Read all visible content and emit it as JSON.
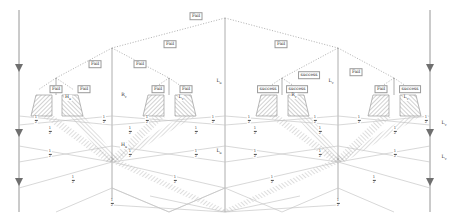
{
  "figure": {
    "width": 449,
    "height": 219,
    "background": "#ffffff",
    "colors": {
      "axis": "#8a8a8a",
      "solid_edge": "#b9b9b9",
      "dotted_edge": "#a9a9a9",
      "hatch": "#8e8e8e",
      "label_text": "#2e2e2e",
      "label_border": "#9a9a9a"
    }
  },
  "labels": {
    "fail": "Fail",
    "success": "success",
    "fraction_numerator": "1",
    "fraction_denominator": "2"
  },
  "tree": {
    "root": {
      "x": 225,
      "y": 18,
      "edge_label": "Fail"
    },
    "level1": [
      {
        "id": "n-l1-left",
        "x": 112,
        "y": 48,
        "edge_label": "Fail"
      },
      {
        "id": "n-l1-right",
        "x": 338,
        "y": 48,
        "edge_label": "Fail"
      }
    ],
    "level2": [
      {
        "id": "n-l2-a",
        "x": 56,
        "y": 78,
        "edge_label": "Fail"
      },
      {
        "id": "n-l2-b",
        "x": 169,
        "y": 78,
        "edge_label": "Fail"
      },
      {
        "id": "n-l2-c",
        "x": 282,
        "y": 78,
        "edge_label": "success"
      },
      {
        "id": "n-l2-d",
        "x": 394,
        "y": 78,
        "edge_label": "Fail"
      }
    ]
  },
  "edge_labels": [
    {
      "id": "e-root",
      "text": "Fail",
      "x": 196,
      "y": 16
    },
    {
      "id": "e-l1-left",
      "text": "Fail",
      "x": 170,
      "y": 44
    },
    {
      "id": "e-l1-right",
      "text": "Fail",
      "x": 281,
      "y": 44
    },
    {
      "id": "e-l2-a",
      "text": "Fail",
      "x": 95,
      "y": 64
    },
    {
      "id": "e-l2-b",
      "text": "Fail",
      "x": 140,
      "y": 64
    },
    {
      "id": "e-l2-c",
      "text": "success",
      "x": 309,
      "y": 75
    },
    {
      "id": "e-l2-d",
      "text": "Fail",
      "x": 356,
      "y": 72
    },
    {
      "id": "e-leaf-a1",
      "text": "Fail",
      "x": 56,
      "y": 89
    },
    {
      "id": "e-leaf-a2",
      "text": "Fail",
      "x": 84,
      "y": 89
    },
    {
      "id": "e-leaf-b1",
      "text": "Fail",
      "x": 158,
      "y": 89
    },
    {
      "id": "e-leaf-b2",
      "text": "Fail",
      "x": 186,
      "y": 89
    },
    {
      "id": "e-leaf-c1",
      "text": "success",
      "x": 268,
      "y": 89
    },
    {
      "id": "e-leaf-c2",
      "text": "success",
      "x": 297,
      "y": 89
    },
    {
      "id": "e-leaf-d1",
      "text": "Fail",
      "x": 381,
      "y": 89
    },
    {
      "id": "e-leaf-d2",
      "text": "success",
      "x": 410,
      "y": 89
    }
  ],
  "node_labels": [
    {
      "id": "nl-hu",
      "base": "H",
      "sub": "u",
      "x": 68,
      "y": 98
    },
    {
      "id": "nl-rv1",
      "base": "R",
      "sub": "v",
      "x": 124,
      "y": 96
    },
    {
      "id": "nl-lv1",
      "base": "L",
      "sub": "v",
      "x": 181,
      "y": 98
    },
    {
      "id": "nl-lu1",
      "base": "L",
      "sub": "u",
      "x": 219,
      "y": 82
    },
    {
      "id": "nl-rv2",
      "base": "R",
      "sub": "v",
      "x": 294,
      "y": 96
    },
    {
      "id": "nl-lv2",
      "base": "L",
      "sub": "v",
      "x": 331,
      "y": 82
    },
    {
      "id": "nl-lu2",
      "base": "L",
      "sub": "v",
      "x": 406,
      "y": 98
    },
    {
      "id": "nl-hu2",
      "base": "H",
      "sub": "u",
      "x": 124,
      "y": 146
    },
    {
      "id": "nl-lu3",
      "base": "L",
      "sub": "u",
      "x": 219,
      "y": 152
    },
    {
      "id": "nl-lu4",
      "base": "L",
      "sub": "v",
      "x": 444,
      "y": 124
    },
    {
      "id": "nl-lu5",
      "base": "L",
      "sub": "v",
      "x": 444,
      "y": 158
    }
  ],
  "fraction_labels": [
    {
      "id": "f-01",
      "x": 36,
      "y": 120
    },
    {
      "id": "f-02",
      "x": 104,
      "y": 120
    },
    {
      "id": "f-03",
      "x": 147,
      "y": 120
    },
    {
      "id": "f-04",
      "x": 213,
      "y": 120
    },
    {
      "id": "f-05",
      "x": 249,
      "y": 120
    },
    {
      "id": "f-06",
      "x": 315,
      "y": 120
    },
    {
      "id": "f-07",
      "x": 359,
      "y": 120
    },
    {
      "id": "f-08",
      "x": 426,
      "y": 120
    },
    {
      "id": "f-09",
      "x": 50,
      "y": 131
    },
    {
      "id": "f-10",
      "x": 130,
      "y": 131
    },
    {
      "id": "f-11",
      "x": 196,
      "y": 131
    },
    {
      "id": "f-12",
      "x": 255,
      "y": 131
    },
    {
      "id": "f-13",
      "x": 320,
      "y": 131
    },
    {
      "id": "f-14",
      "x": 395,
      "y": 131
    },
    {
      "id": "f-15",
      "x": 50,
      "y": 154
    },
    {
      "id": "f-16",
      "x": 130,
      "y": 154
    },
    {
      "id": "f-17",
      "x": 196,
      "y": 154
    },
    {
      "id": "f-18",
      "x": 255,
      "y": 154
    },
    {
      "id": "f-19",
      "x": 320,
      "y": 154
    },
    {
      "id": "f-20",
      "x": 395,
      "y": 154
    },
    {
      "id": "f-21",
      "x": 73,
      "y": 180
    },
    {
      "id": "f-22",
      "x": 175,
      "y": 180
    },
    {
      "id": "f-23",
      "x": 272,
      "y": 180
    },
    {
      "id": "f-24",
      "x": 374,
      "y": 180
    },
    {
      "id": "f-25",
      "x": 112,
      "y": 203
    },
    {
      "id": "f-26",
      "x": 338,
      "y": 203
    }
  ],
  "axes": [
    {
      "id": "axis-left",
      "x": 19,
      "y1": 10,
      "y2": 212,
      "arrows": [
        68,
        133,
        182
      ]
    },
    {
      "id": "axis-right",
      "x": 430,
      "y1": 10,
      "y2": 212,
      "arrows": [
        68,
        133,
        182
      ]
    }
  ],
  "verticals": [
    {
      "id": "v-center",
      "x": 225,
      "y1": 18,
      "y2": 212
    },
    {
      "id": "v-l1-left",
      "x": 112,
      "y1": 48,
      "y2": 205
    },
    {
      "id": "v-l1-right",
      "x": 338,
      "y1": 48,
      "y2": 205
    }
  ]
}
